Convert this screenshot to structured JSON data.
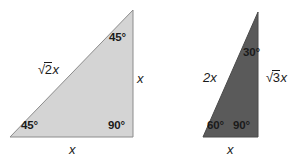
{
  "figure": {
    "background_color": "#ffffff",
    "triangles": [
      {
        "id": "triangle-45-45-90",
        "name": "isosceles-right-triangle",
        "fill_color": "#d4d4d4",
        "stroke_color": "#8c8c8c",
        "points": "10,137 133,137 133,10",
        "angles": [
          {
            "id": "top",
            "label": "45°"
          },
          {
            "id": "bottom-left",
            "label": "45°"
          },
          {
            "id": "bottom-right",
            "label": "90°"
          }
        ],
        "sides": [
          {
            "id": "hypotenuse",
            "radical": "2",
            "tail": "x"
          },
          {
            "id": "vertical",
            "label": "x"
          },
          {
            "id": "base",
            "label": "x"
          }
        ]
      },
      {
        "id": "triangle-30-60-90",
        "name": "scalene-right-triangle",
        "fill_color": "#5a5a5a",
        "stroke_color": "#4a4a4a",
        "points": "203,137 258,137 258,12",
        "angles": [
          {
            "id": "top",
            "label": "30°"
          },
          {
            "id": "bottom-left",
            "label": "60°"
          },
          {
            "id": "bottom-right",
            "label": "90°"
          }
        ],
        "sides": [
          {
            "id": "hypotenuse",
            "label": "2x"
          },
          {
            "id": "vertical",
            "radical": "3",
            "tail": "x"
          },
          {
            "id": "base",
            "label": "x"
          }
        ]
      }
    ],
    "radical_sign": "√"
  }
}
